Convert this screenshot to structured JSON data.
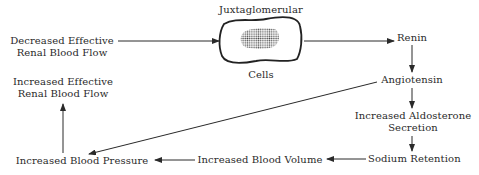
{
  "diagram": {
    "type": "flowchart",
    "nodes": {
      "decreased_rbf": {
        "line1": "Decreased Effective",
        "line2": "Renal Blood Flow"
      },
      "jg_top": "Juxtaglomerular",
      "jg_bottom": "Cells",
      "renin": "Renin",
      "angiotensin": "Angiotensin",
      "aldosterone": {
        "line1": "Increased Aldosterone",
        "line2": "Secretion"
      },
      "sodium": "Sodium Retention",
      "blood_volume": "Increased Blood Volume",
      "blood_pressure": "Increased Blood Pressure",
      "increased_rbf": {
        "line1": "Increased Effective",
        "line2": "Renal Blood Flow"
      }
    },
    "edges": [
      {
        "from": "Decreased Effective Renal Blood Flow",
        "to": "Juxtaglomerular Cells"
      },
      {
        "from": "Juxtaglomerular Cells",
        "to": "Renin"
      },
      {
        "from": "Renin",
        "to": "Angiotensin"
      },
      {
        "from": "Angiotensin",
        "to": "Increased Aldosterone Secretion"
      },
      {
        "from": "Angiotensin",
        "to": "Increased Blood Pressure"
      },
      {
        "from": "Increased Aldosterone Secretion",
        "to": "Sodium Retention"
      },
      {
        "from": "Sodium Retention",
        "to": "Increased Blood Volume"
      },
      {
        "from": "Increased Blood Volume",
        "to": "Increased Blood Pressure"
      },
      {
        "from": "Increased Blood Pressure",
        "to": "Increased Effective Renal Blood Flow"
      }
    ],
    "colors": {
      "line": "#2a2a2a",
      "text": "#2a2a2a",
      "background": "#ffffff"
    }
  }
}
